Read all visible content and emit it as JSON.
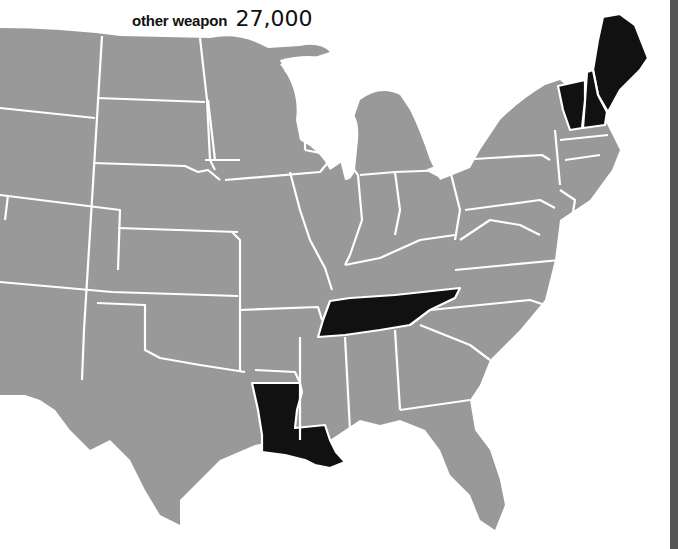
{
  "title": {
    "label": "other weapon",
    "value": "27,000"
  },
  "colors": {
    "default_state": "#999999",
    "highlighted_state": "#111111",
    "border": "#ffffff",
    "background": "#ffffff",
    "right_bar": "#555555"
  },
  "map": {
    "region": "Contiguous United States",
    "highlighted_states": [
      "Maine",
      "New Hampshire",
      "Vermont",
      "Tennessee",
      "Louisiana"
    ]
  }
}
